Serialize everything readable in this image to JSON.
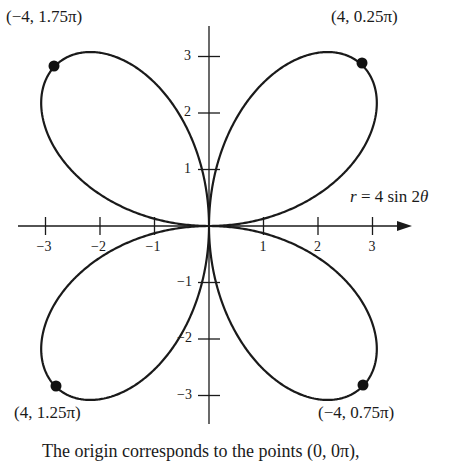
{
  "chart_data": {
    "type": "line",
    "subtype": "polar-rose",
    "equation": "r = 4 sin 2θ",
    "equation_parts": {
      "r": "r",
      "eq": " = 4 sin 2",
      "theta": "θ"
    },
    "series": [
      {
        "name": "r = 4 sin 2θ",
        "function": "r = 4*sin(2*theta)",
        "theta_range": [
          0,
          "2π"
        ],
        "petals": 4,
        "max_r": 4
      }
    ],
    "highlighted_points": [
      {
        "label": "(4, 0.25π)",
        "r": 4,
        "theta": "0.25π",
        "x": 2.83,
        "y": 2.83
      },
      {
        "label": "(−4, 0.75π)",
        "r": -4,
        "theta": "0.75π",
        "x": 2.83,
        "y": -2.83
      },
      {
        "label": "(4, 1.25π)",
        "r": 4,
        "theta": "1.25π",
        "x": -2.83,
        "y": -2.83
      },
      {
        "label": "(−4, 1.75π)",
        "r": -4,
        "theta": "1.75π",
        "x": -2.83,
        "y": 2.83
      }
    ],
    "x_ticks": [
      "−3",
      "−2",
      "−1",
      "1",
      "2",
      "3"
    ],
    "y_ticks": [
      "3",
      "2",
      "1",
      "−1",
      "−2",
      "−3"
    ],
    "xlim": [
      -3.2,
      3.7
    ],
    "ylim": [
      -3.5,
      3.5
    ],
    "xlabel": "",
    "ylabel": "",
    "grid": false,
    "legend": "none",
    "caption": "The origin corresponds to the points (0, 0π),"
  },
  "labels": {
    "top_right": "(4, 0.25π)",
    "top_left": "(−4, 1.75π)",
    "bottom_left": "(4, 1.25π)",
    "bottom_right": "(−4, 0.75π)"
  },
  "ticks": {
    "x": [
      {
        "v": -3,
        "t": "−3"
      },
      {
        "v": -2,
        "t": "−2"
      },
      {
        "v": -1,
        "t": "−1"
      },
      {
        "v": 1,
        "t": "1"
      },
      {
        "v": 2,
        "t": "2"
      },
      {
        "v": 3,
        "t": "3"
      }
    ],
    "y": [
      {
        "v": 3,
        "t": "3"
      },
      {
        "v": 2,
        "t": "2"
      },
      {
        "v": 1,
        "t": "1"
      },
      {
        "v": -1,
        "t": "−1"
      },
      {
        "v": -2,
        "t": "−2"
      },
      {
        "v": -3,
        "t": "−3"
      }
    ]
  },
  "colors": {
    "curve": "#1a1a1a",
    "axis": "#1a1a1a",
    "background": "#ffffff"
  }
}
